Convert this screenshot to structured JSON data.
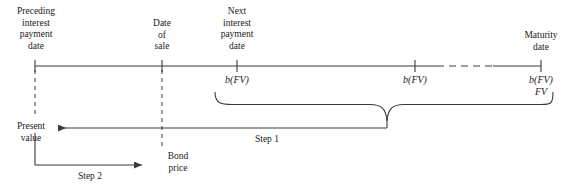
{
  "diagram": {
    "line_color": "#3a3a3a",
    "text_color": "#1a1a1a",
    "timeline": {
      "axis_y": 66,
      "start_x": 35,
      "end_x": 541,
      "dashed_segment": {
        "from_x": 437,
        "to_x": 493
      },
      "events": [
        {
          "id": "preceding-interest-payment-date",
          "label": "Preceding\ninterest\npayment\ndate",
          "x": 35,
          "cashflow": ""
        },
        {
          "id": "date-of-sale",
          "label": "Date\nof\nsale",
          "x": 162,
          "cashflow": ""
        },
        {
          "id": "next-interest-payment-date",
          "label": "Next\ninterest\npayment\ndate",
          "x": 237,
          "cashflow": "b(FV)"
        },
        {
          "id": "intermediate-coupon",
          "label": "",
          "x": 415,
          "cashflow": "b(FV)"
        },
        {
          "id": "maturity-date",
          "label": "Maturity\ndate",
          "x": 541,
          "cashflow": "b(FV)\nFV"
        }
      ]
    },
    "brace": {
      "left_x": 215,
      "right_x": 552,
      "center_x": 387,
      "top_y": 92,
      "bottom_y": 128
    },
    "steps": [
      {
        "id": "step-1",
        "label": "Step 1",
        "label_x": 267,
        "label_y": 134,
        "from_x": 387,
        "to_x": 58,
        "y": 128
      },
      {
        "id": "step-2",
        "label": "Step 2",
        "label_x": 90,
        "label_y": 171,
        "from_x": 35,
        "to_x": 142,
        "y": 165
      }
    ],
    "value_labels": [
      {
        "id": "present-value",
        "label": "Present\nvalue",
        "x": 31,
        "y": 121
      },
      {
        "id": "bond-price",
        "label": "Bond\nprice",
        "x": 178,
        "y": 151
      }
    ],
    "drop_lines": [
      {
        "id": "preceding-drop-line",
        "x": 35,
        "from_y": 70,
        "to_y": 116
      },
      {
        "id": "sale-drop-line",
        "x": 162,
        "from_y": 70,
        "to_y": 148
      }
    ]
  }
}
